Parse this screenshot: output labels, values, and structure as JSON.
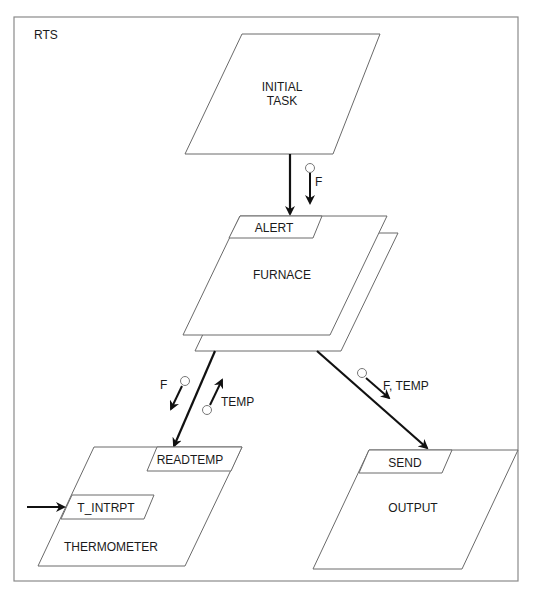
{
  "diagram": {
    "frame_label": "RTS",
    "tasks": {
      "initial": {
        "line1": "INITIAL",
        "line2": "TASK"
      },
      "furnace": {
        "name": "FURNACE",
        "entry": "ALERT"
      },
      "thermometer": {
        "name": "THERMOMETER",
        "entries": [
          "READTEMP",
          "T_INTRPT"
        ]
      },
      "output": {
        "name": "OUTPUT",
        "entry": "SEND"
      }
    },
    "couples": {
      "initial_to_furnace": "F",
      "furnace_to_thermometer_out": "F",
      "thermometer_to_furnace_back": "TEMP",
      "furnace_to_output": "F, TEMP"
    },
    "colors": {
      "line": "#6a6a6a",
      "arrow": "#111111",
      "frame": "#8a8a8a",
      "background": "#ffffff"
    }
  }
}
